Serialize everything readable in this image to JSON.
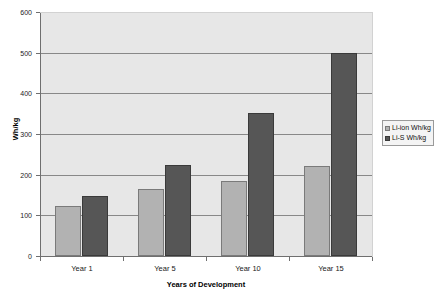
{
  "chart_data": {
    "type": "bar",
    "title": "",
    "categories": [
      "Year 1",
      "Year 5",
      "Year 10",
      "Year 15"
    ],
    "series": [
      {
        "name": "Li-ion Wh/kg",
        "values": [
          123,
          165,
          184,
          221
        ],
        "color": "#b2b2b2"
      },
      {
        "name": "Li-S Wh/kg",
        "values": [
          148,
          225,
          352,
          500
        ],
        "color": "#565656"
      }
    ],
    "xlabel": "Years of Development",
    "ylabel": "Wh/kg",
    "ylim": [
      0,
      600
    ],
    "ytick_step": 100,
    "yticks": [
      0,
      100,
      200,
      300,
      400,
      500,
      600
    ],
    "ytick_labels": [
      "0",
      "100",
      "200",
      "300",
      "400",
      "500",
      "600"
    ],
    "grid": "horizontal",
    "legend_position": "right",
    "plot_background": "#e7e7e7",
    "figure_background": "#ffffff"
  },
  "axes": {
    "y_title": "Wh/kg",
    "x_title": "Years of Development"
  },
  "legend": {
    "entries": [
      {
        "label": "Li-ion Wh/kg"
      },
      {
        "label": "Li-S Wh/kg"
      }
    ]
  }
}
